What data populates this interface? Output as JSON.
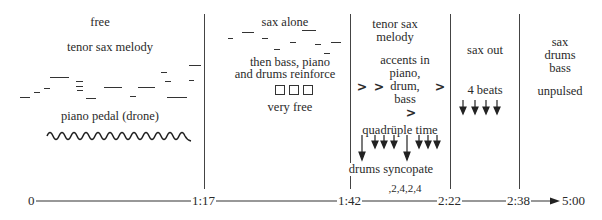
{
  "sections": [
    {
      "id": "s1",
      "start": "0",
      "end": "1:17",
      "labels": {
        "top": "free",
        "melody": "tenor sax melody",
        "drone": "piano pedal (drone)"
      }
    },
    {
      "id": "s2",
      "start": "1:17",
      "end": "1:42",
      "labels": {
        "top": "sax alone",
        "reinforce_line1": "then bass, piano",
        "reinforce_line2": "and drums reinforce",
        "boxes": "□□□",
        "bottom": "very free"
      }
    },
    {
      "id": "s3",
      "start": "1:42",
      "end": "2:22",
      "labels": {
        "top_line1": "tenor sax",
        "top_line2": "melody",
        "accents_line1": "accents in",
        "accents_line2": "piano,",
        "accents_line3": "drum,",
        "accents_line4": "bass",
        "accent_mark": ">",
        "quadruple": "quadrüple time",
        "drums": "drums syncopate",
        "count": "₁22₁4₁22₁4"
      }
    },
    {
      "id": "s4",
      "start": "2:22",
      "end": "2:38",
      "labels": {
        "top": "sax out",
        "beats": "4 beats"
      }
    },
    {
      "id": "s5",
      "start": "2:38",
      "end": "5:00",
      "labels": {
        "line1": "sax",
        "line2": "drums",
        "line3": "bass",
        "bottom": "unpulsed"
      }
    }
  ],
  "timeline": {
    "ticks": [
      "0",
      "1:17",
      "1:42",
      "2:22",
      "2:38",
      "5:00"
    ]
  },
  "count_display": ",2,4,2,4"
}
